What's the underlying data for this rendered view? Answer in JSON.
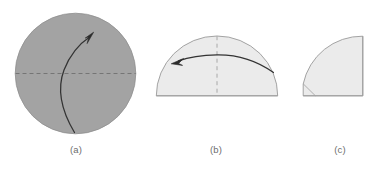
{
  "figure": {
    "background_color": "#ffffff",
    "panels": [
      {
        "id": "a",
        "caption": "(a)",
        "shape_name": "full-disk",
        "fill_color": "#a3a3a3",
        "stroke_color": "#8f8f8f",
        "center": {
          "x": 75.5,
          "y": 73.5
        },
        "radius": 60.5,
        "dashed_line": {
          "name": "horizontal-diameter-dashed",
          "x1": 15,
          "y1": 73.5,
          "x2": 136,
          "y2": 73.5,
          "color": "#707070",
          "dash": "4 3"
        },
        "curved_arrow": {
          "name": "folding-direction-arrow",
          "color": "#333333",
          "start": {
            "x": 74,
            "y": 132
          },
          "end": {
            "x": 93,
            "y": 35
          },
          "direction": "upward-right"
        }
      },
      {
        "id": "b",
        "caption": "(b)",
        "shape_name": "half-disk-dome",
        "fill_color": "#ebebeb",
        "stroke_color": "#9a9a9a",
        "center": {
          "x": 217,
          "y": 96
        },
        "radius": 61,
        "baseline": {
          "x1": 156,
          "y1": 96,
          "x2": 278,
          "y2": 96
        },
        "dashed_line": {
          "name": "vertical-centerline-dashed",
          "x1": 217,
          "y1": 36,
          "x2": 217,
          "y2": 96,
          "color": "#9a9a9a",
          "dash": "4 3"
        },
        "curved_arrow": {
          "name": "folding-direction-arrow",
          "color": "#333333",
          "start": {
            "x": 273,
            "y": 71
          },
          "end": {
            "x": 176,
            "y": 58
          },
          "direction": "leftward"
        }
      },
      {
        "id": "c",
        "caption": "(c)",
        "shape_name": "quarter-disk",
        "fill_color": "#ebebeb",
        "stroke_color": "#9a9a9a",
        "corner": {
          "x": 303,
          "y": 96
        },
        "radius": 60,
        "right_edge": {
          "x1": 363,
          "y1": 36,
          "x2": 363,
          "y2": 96
        },
        "bottom_edge": {
          "x1": 303,
          "y1": 96,
          "x2": 363,
          "y2": 96
        },
        "chamfer_line": {
          "name": "corner-crease-line",
          "x1": 303,
          "y1": 84,
          "x2": 315,
          "y2": 96,
          "color": "#9a9a9a"
        }
      }
    ]
  },
  "colors": {
    "disk_gray": "#a3a3a3",
    "light_gray": "#ebebeb",
    "outline_gray": "#9a9a9a",
    "arrow_dark": "#333333",
    "caption_gray": "#6d6d6d"
  }
}
